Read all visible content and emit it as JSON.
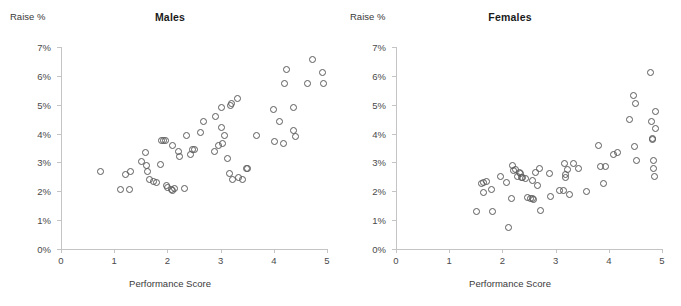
{
  "figure": {
    "background": "#ffffff",
    "marker_color": "#5b5b5b"
  },
  "panels": [
    {
      "key": "males",
      "title": "Males",
      "ylabel": "Raise %",
      "xlabel": "Performance Score"
    },
    {
      "key": "females",
      "title": "Females",
      "ylabel": "Raise %",
      "xlabel": "Performance Score"
    }
  ],
  "axes": {
    "y_ticks": [
      "0%",
      "1%",
      "2%",
      "3%",
      "4%",
      "5%",
      "6%",
      "7%"
    ],
    "x_ticks": [
      "0",
      "1",
      "2",
      "3",
      "4",
      "5"
    ]
  },
  "chart_data": [
    {
      "type": "scatter",
      "title": "Males",
      "xlabel": "Performance Score",
      "ylabel": "Raise %",
      "xlim": [
        0,
        5
      ],
      "ylim": [
        0,
        7
      ],
      "ytick_labels": [
        "0%",
        "1%",
        "2%",
        "3%",
        "4%",
        "5%",
        "6%",
        "7%"
      ],
      "xtick_labels": [
        "0",
        "1",
        "2",
        "3",
        "4",
        "5"
      ],
      "grid": false,
      "legend": "none",
      "series": [
        {
          "name": "Males",
          "points": [
            [
              0.74,
              2.7
            ],
            [
              1.11,
              2.08
            ],
            [
              1.21,
              2.6
            ],
            [
              1.27,
              2.08
            ],
            [
              1.29,
              2.72
            ],
            [
              1.5,
              3.05
            ],
            [
              1.58,
              3.36
            ],
            [
              1.6,
              2.92
            ],
            [
              1.62,
              2.72
            ],
            [
              1.66,
              2.41
            ],
            [
              1.72,
              2.36
            ],
            [
              1.78,
              2.33
            ],
            [
              1.86,
              2.95
            ],
            [
              1.88,
              3.78
            ],
            [
              1.91,
              3.77
            ],
            [
              1.95,
              3.78
            ],
            [
              1.98,
              2.21
            ],
            [
              2.0,
              2.16
            ],
            [
              2.07,
              2.08
            ],
            [
              2.08,
              2.05
            ],
            [
              2.09,
              3.61
            ],
            [
              2.12,
              2.13
            ],
            [
              2.19,
              3.41
            ],
            [
              2.21,
              3.24
            ],
            [
              2.31,
              2.12
            ],
            [
              2.35,
              3.94
            ],
            [
              2.42,
              3.3
            ],
            [
              2.46,
              3.45
            ],
            [
              2.5,
              3.48
            ],
            [
              2.62,
              4.04
            ],
            [
              2.66,
              4.44
            ],
            [
              2.87,
              3.4
            ],
            [
              2.9,
              4.6
            ],
            [
              2.95,
              3.62
            ],
            [
              3.0,
              4.22
            ],
            [
              3.01,
              4.93
            ],
            [
              3.03,
              3.66
            ],
            [
              3.07,
              3.95
            ],
            [
              3.12,
              3.14
            ],
            [
              3.16,
              2.65
            ],
            [
              3.18,
              5.0
            ],
            [
              3.2,
              5.06
            ],
            [
              3.21,
              2.44
            ],
            [
              3.3,
              5.25
            ],
            [
              3.33,
              2.48
            ],
            [
              3.41,
              2.41
            ],
            [
              3.47,
              2.8
            ],
            [
              3.5,
              2.8
            ],
            [
              3.66,
              3.96
            ],
            [
              3.98,
              4.84
            ],
            [
              4.0,
              3.74
            ],
            [
              4.09,
              4.44
            ],
            [
              4.18,
              3.68
            ],
            [
              4.19,
              5.75
            ],
            [
              4.22,
              6.24
            ],
            [
              4.36,
              4.92
            ],
            [
              4.37,
              4.13
            ],
            [
              4.39,
              3.9
            ],
            [
              4.62,
              5.74
            ],
            [
              4.71,
              6.58
            ],
            [
              4.9,
              6.13
            ],
            [
              4.92,
              5.74
            ]
          ]
        }
      ]
    },
    {
      "type": "scatter",
      "title": "Females",
      "xlabel": "Performance Score",
      "ylabel": "Raise %",
      "xlim": [
        0,
        5
      ],
      "ylim": [
        0,
        7
      ],
      "ytick_labels": [
        "0%",
        "1%",
        "2%",
        "3%",
        "4%",
        "5%",
        "6%",
        "7%"
      ],
      "xtick_labels": [
        "0",
        "1",
        "2",
        "3",
        "4",
        "5"
      ],
      "grid": false,
      "legend": "none",
      "series": [
        {
          "name": "Females",
          "points": [
            [
              1.5,
              1.31
            ],
            [
              1.59,
              2.28
            ],
            [
              1.63,
              2.33
            ],
            [
              1.64,
              1.97
            ],
            [
              1.7,
              2.35
            ],
            [
              1.79,
              2.08
            ],
            [
              1.81,
              1.32
            ],
            [
              1.95,
              2.52
            ],
            [
              2.06,
              2.31
            ],
            [
              2.1,
              0.75
            ],
            [
              2.16,
              1.77
            ],
            [
              2.18,
              2.9
            ],
            [
              2.2,
              2.75
            ],
            [
              2.23,
              2.78
            ],
            [
              2.28,
              2.53
            ],
            [
              2.32,
              2.68
            ],
            [
              2.33,
              2.62
            ],
            [
              2.35,
              2.49
            ],
            [
              2.36,
              2.49
            ],
            [
              2.43,
              2.46
            ],
            [
              2.47,
              1.8
            ],
            [
              2.52,
              1.76
            ],
            [
              2.55,
              1.77
            ],
            [
              2.56,
              2.4
            ],
            [
              2.58,
              1.73
            ],
            [
              2.62,
              2.67
            ],
            [
              2.65,
              2.22
            ],
            [
              2.68,
              2.82
            ],
            [
              2.7,
              1.34
            ],
            [
              2.88,
              2.65
            ],
            [
              2.9,
              1.85
            ],
            [
              3.07,
              2.03
            ],
            [
              3.13,
              2.06
            ],
            [
              3.16,
              2.97
            ],
            [
              3.17,
              2.61
            ],
            [
              3.18,
              2.48
            ],
            [
              3.22,
              2.77
            ],
            [
              3.26,
              1.9
            ],
            [
              3.33,
              2.97
            ],
            [
              3.42,
              2.81
            ],
            [
              3.58,
              2.0
            ],
            [
              3.8,
              3.59
            ],
            [
              3.83,
              2.88
            ],
            [
              3.9,
              2.27
            ],
            [
              3.93,
              2.87
            ],
            [
              4.08,
              3.3
            ],
            [
              4.16,
              3.36
            ],
            [
              4.38,
              4.5
            ],
            [
              4.45,
              5.35
            ],
            [
              4.48,
              3.58
            ],
            [
              4.5,
              5.05
            ],
            [
              4.52,
              3.1
            ],
            [
              4.78,
              6.12
            ],
            [
              4.8,
              4.43
            ],
            [
              4.81,
              3.85
            ],
            [
              4.82,
              3.82
            ],
            [
              4.83,
              3.1
            ],
            [
              4.84,
              2.8
            ],
            [
              4.85,
              2.53
            ],
            [
              4.86,
              4.78
            ],
            [
              4.87,
              4.19
            ]
          ]
        }
      ]
    }
  ]
}
